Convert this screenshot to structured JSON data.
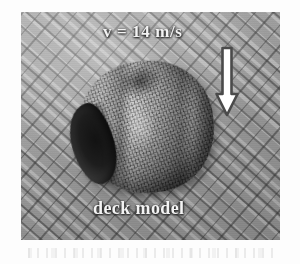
{
  "figure": {
    "type": "photograph",
    "background_color": "#9d9d9d",
    "annotation_color": "#f3f3f3"
  },
  "annotations": {
    "velocity_label": "v = 14 m/s",
    "caption_label": "deck model",
    "flow_arrow": {
      "icon": "down-arrow-icon",
      "direction": "down",
      "fill_color": "#ffffff",
      "outline_color": "#4a4a4a"
    }
  },
  "measurements": {
    "velocity_value": 14,
    "velocity_unit": "m/s",
    "velocity_symbol": "v"
  }
}
